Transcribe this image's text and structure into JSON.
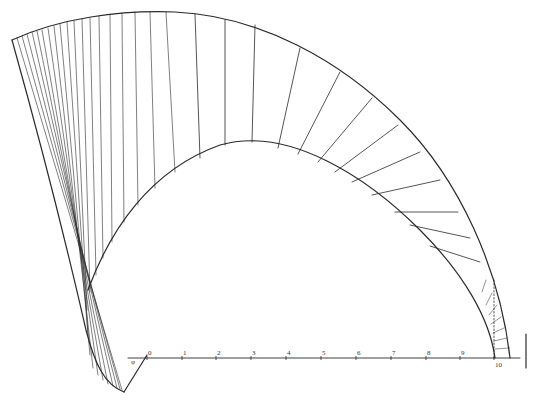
{
  "figure": {
    "type": "geometric construction diagram",
    "ink_color": "#2a2a2a",
    "background": "#ffffff"
  },
  "scale_axis": {
    "tick_labels": [
      "0",
      "1",
      "2",
      "3",
      "4",
      "5",
      "6",
      "7",
      "8",
      "9",
      "10"
    ],
    "tick_x": [
      147,
      182,
      216,
      251,
      286,
      321,
      356,
      391,
      426,
      460,
      494
    ],
    "y": 358,
    "x_start": 128,
    "x_end": 520
  },
  "angle_mark": {
    "label": "φ"
  }
}
